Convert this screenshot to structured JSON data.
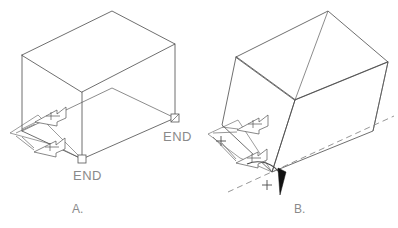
{
  "figure": {
    "background_color": "#ffffff",
    "line_color": "#4a4a4a",
    "text_color": "#8a8a8a",
    "accent_color": "#111111",
    "width": 398,
    "height": 228
  },
  "panels": [
    {
      "id": "A",
      "caption": "A.",
      "description": "Upright isometric box with two END markers and double dimension arrows",
      "end_labels": [
        "END",
        "END"
      ],
      "arrow_count": 2,
      "arrow_glyphs": [
        "x",
        "+"
      ]
    },
    {
      "id": "B",
      "caption": "B.",
      "description": "Box rotated about a dashed axis, rotation direction marked positive",
      "arrow_count": 2,
      "arrow_glyphs": [
        "x",
        "+"
      ],
      "rotation_sign": "+",
      "axis_style": "dashed"
    }
  ],
  "labels": {
    "end_a_bottom": "END",
    "end_a_right": "END",
    "caption_a": "A.",
    "caption_b": "B.",
    "plus_sign": "+",
    "x_sign": "x"
  }
}
